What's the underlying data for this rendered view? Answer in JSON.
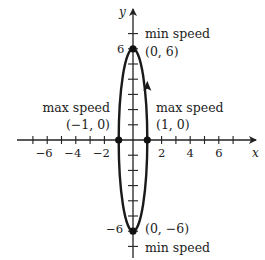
{
  "diagram": {
    "type": "parametric-ellipse",
    "axes": {
      "x_label": "x",
      "y_label": "y",
      "x_ticks": [
        -7,
        -6,
        -5,
        -4,
        -3,
        -2,
        -1,
        1,
        2,
        3,
        4,
        5,
        6,
        7
      ],
      "x_tick_labels": [
        "−6",
        "−4",
        "−2",
        "2",
        "4",
        "6"
      ],
      "x_tick_label_values": [
        -6,
        -4,
        -2,
        2,
        4,
        6
      ],
      "y_ticks": [
        -7,
        -6,
        -5,
        -4,
        -3,
        -2,
        -1,
        1,
        2,
        3,
        4,
        5,
        6,
        7
      ],
      "y_tick_labels": [
        "6",
        "−6"
      ],
      "y_tick_label_values": [
        6,
        -6
      ]
    },
    "curve": {
      "semi_axis_x": 1,
      "semi_axis_y": 6,
      "direction": "counterclockwise",
      "arrow_at": [
        1,
        3.5
      ]
    },
    "points": [
      {
        "coord": [
          0,
          6
        ],
        "coord_label": "(0, 6)",
        "speed_label": "min speed"
      },
      {
        "coord": [
          0,
          -6
        ],
        "coord_label": "(0, −6)",
        "speed_label": "min speed"
      },
      {
        "coord": [
          -1,
          0
        ],
        "coord_label": "(−1, 0)",
        "speed_label": "max speed"
      },
      {
        "coord": [
          1,
          0
        ],
        "coord_label": "(1, 0)",
        "speed_label": "max speed"
      }
    ],
    "colors": {
      "ink": "#222222",
      "background": "#ffffff"
    }
  }
}
